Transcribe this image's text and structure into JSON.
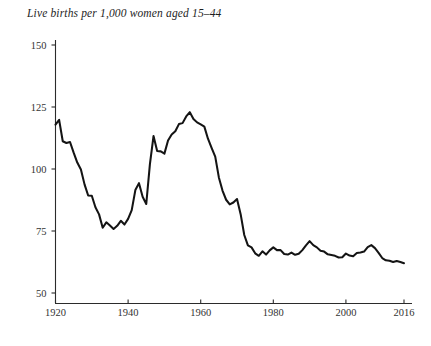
{
  "chart_data": {
    "type": "line",
    "title": "Live births per 1,000 women aged 15–44",
    "xlabel": "",
    "ylabel": "",
    "xlim": [
      1920,
      2016
    ],
    "ylim": [
      43,
      155
    ],
    "grid": false,
    "legend": null,
    "yticks": [
      50,
      75,
      100,
      125,
      150
    ],
    "ytick_labels": [
      "50",
      "75",
      "100",
      "125",
      "150"
    ],
    "xticks": [
      1920,
      1940,
      1960,
      1980,
      2000,
      2016
    ],
    "xtick_labels": [
      "1920",
      "1940",
      "1960",
      "1980",
      "2000",
      "2016"
    ],
    "series": [
      {
        "name": "Live births per 1,000 women aged 15-44",
        "x": [
          1920,
          1921,
          1922,
          1923,
          1924,
          1925,
          1926,
          1927,
          1928,
          1929,
          1930,
          1931,
          1932,
          1933,
          1934,
          1935,
          1936,
          1937,
          1938,
          1939,
          1940,
          1941,
          1942,
          1943,
          1944,
          1945,
          1946,
          1947,
          1948,
          1949,
          1950,
          1951,
          1952,
          1953,
          1954,
          1955,
          1956,
          1957,
          1958,
          1959,
          1960,
          1961,
          1962,
          1963,
          1964,
          1965,
          1966,
          1967,
          1968,
          1969,
          1970,
          1971,
          1972,
          1973,
          1974,
          1975,
          1976,
          1977,
          1978,
          1979,
          1980,
          1981,
          1982,
          1983,
          1984,
          1985,
          1986,
          1987,
          1988,
          1989,
          1990,
          1991,
          1992,
          1993,
          1994,
          1995,
          1996,
          1997,
          1998,
          1999,
          2000,
          2001,
          2002,
          2003,
          2004,
          2005,
          2006,
          2007,
          2008,
          2009,
          2010,
          2011,
          2012,
          2013,
          2014,
          2015,
          2016
        ],
        "values": [
          117.9,
          119.8,
          111.2,
          110.5,
          110.9,
          106.6,
          102.6,
          99.8,
          93.8,
          89.3,
          89.2,
          84.6,
          81.7,
          76.3,
          78.5,
          77.2,
          75.8,
          77.1,
          79.1,
          77.6,
          79.9,
          83.4,
          91.5,
          94.3,
          88.8,
          85.9,
          101.9,
          113.3,
          107.3,
          107.1,
          106.2,
          111.5,
          113.9,
          115.2,
          118.1,
          118.5,
          121.2,
          122.9,
          120.2,
          118.8,
          118.0,
          117.1,
          112.2,
          108.5,
          105.0,
          96.6,
          91.3,
          87.6,
          85.7,
          86.5,
          87.9,
          81.8,
          73.4,
          69.2,
          68.4,
          66.0,
          65.0,
          66.8,
          65.5,
          67.2,
          68.4,
          67.3,
          67.3,
          65.7,
          65.5,
          66.3,
          65.4,
          65.8,
          67.3,
          69.2,
          70.9,
          69.3,
          68.4,
          67.0,
          66.7,
          65.6,
          65.3,
          65.0,
          64.3,
          64.4,
          65.9,
          65.1,
          64.8,
          66.1,
          66.3,
          66.7,
          68.5,
          69.3,
          68.1,
          66.2,
          64.1,
          63.2,
          63.0,
          62.5,
          62.9,
          62.5,
          62.0
        ]
      }
    ]
  },
  "axes": {
    "y_axis_name": "births-per-1000-axis",
    "x_axis_name": "year-axis"
  }
}
